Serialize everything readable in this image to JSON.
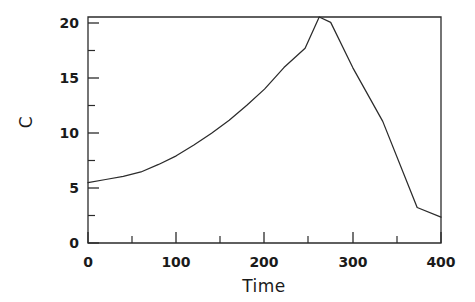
{
  "chart_data": {
    "type": "line",
    "title": "",
    "subtitle": "",
    "xlabel": "Time",
    "ylabel": "C",
    "xlim": [
      0,
      400
    ],
    "ylim": [
      0,
      21
    ],
    "grid": false,
    "legend": null,
    "xticks_major": [
      0,
      100,
      200,
      300,
      400
    ],
    "xticks_major_labels": [
      "0",
      "100",
      "200",
      "300",
      "400"
    ],
    "xticks_minor": [
      50,
      150,
      250,
      350
    ],
    "yticks_major": [
      0,
      5,
      10,
      15,
      20
    ],
    "yticks_major_labels": [
      "0",
      "5",
      "10",
      "15",
      "20"
    ],
    "yticks_minor": [
      2.5,
      7.5,
      12.5,
      17.5
    ],
    "series": [
      {
        "name": "C",
        "x": [
          0,
          20,
          40,
          60,
          80,
          100,
          120,
          140,
          160,
          180,
          200,
          210,
          222,
          246,
          262,
          275,
          300,
          334,
          373,
          400
        ],
        "y": [
          5.6,
          5.9,
          6.2,
          6.6,
          7.3,
          8.1,
          9.1,
          10.2,
          11.4,
          12.8,
          14.3,
          15.2,
          16.3,
          18.1,
          21.0,
          20.5,
          16.3,
          11.3,
          3.3,
          2.4
        ]
      }
    ]
  },
  "axis": {
    "x_title": "Time",
    "y_title": "C"
  },
  "labels": {
    "x": [
      "0",
      "100",
      "200",
      "300",
      "400"
    ],
    "y": [
      "0",
      "5",
      "10",
      "15",
      "20"
    ]
  },
  "colors": {
    "line": "#2b2b2b",
    "frame": "#2b2b2b",
    "background": "#ffffff",
    "text": "#1a1a1a"
  }
}
